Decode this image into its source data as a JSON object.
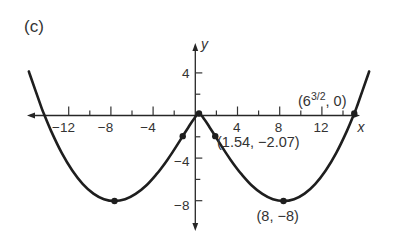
{
  "figure": {
    "panel_label": "(c)",
    "axis_labels": {
      "x": "x",
      "y": "y"
    },
    "x_tick_labels": [
      "−12",
      "−8",
      "−4",
      "4",
      "8",
      "12"
    ],
    "y_tick_labels": [
      "4",
      "−4",
      "−8"
    ],
    "annotations": {
      "inflection": "(1.54, −2.07)",
      "minimum": "(8, −8)",
      "zero": {
        "open": "(6",
        "sup": "3/2",
        "close": ", 0)"
      }
    }
  },
  "chart_data": {
    "type": "line",
    "title": "",
    "panel": "(c)",
    "xlabel": "x",
    "ylabel": "y",
    "xlim": [
      -16.1,
      16.1
    ],
    "ylim": [
      -10,
      6
    ],
    "grid": false,
    "legend": null,
    "x_ticks": [
      -12,
      -10,
      -8,
      -6,
      -4,
      -2,
      2,
      4,
      6,
      8,
      10,
      12,
      14
    ],
    "x_ticks_labeled": [
      -12,
      -8,
      -4,
      4,
      8,
      12
    ],
    "y_ticks": [
      4,
      2,
      -2,
      -4,
      -6,
      -8
    ],
    "y_ticks_labeled": [
      4,
      -4,
      -8
    ],
    "series": [
      {
        "name": "curve",
        "x": [
          -16.1,
          -16,
          -15,
          -14.7,
          -14,
          -13,
          -12,
          -11,
          -10,
          -9,
          -8,
          -7,
          -6,
          -5,
          -4,
          -3.5,
          -3,
          -2.5,
          -2,
          -1.54,
          -1,
          -0.5,
          0,
          0.5,
          1,
          1.54,
          2,
          2.5,
          3,
          3.5,
          4,
          5,
          6,
          7,
          8,
          9,
          10,
          11,
          12,
          13,
          14,
          14.7,
          15,
          16,
          16.1
        ],
        "y": [
          3.83,
          3.52,
          0.76,
          0,
          -1.61,
          -3.6,
          -5.21,
          -6.45,
          -7.32,
          -7.83,
          -8,
          -7.84,
          -7.35,
          -6.58,
          -5.52,
          -4.91,
          -4.24,
          -3.53,
          -2.78,
          -2.07,
          -1.25,
          -0.53,
          0,
          -0.53,
          -1.25,
          -2.07,
          -2.78,
          -3.53,
          -4.24,
          -4.91,
          -5.52,
          -6.58,
          -7.35,
          -7.84,
          -8,
          -7.83,
          -7.32,
          -6.45,
          -5.21,
          -3.6,
          -1.61,
          0,
          0.76,
          3.52,
          3.83
        ]
      }
    ],
    "marked_points": [
      {
        "x": 0,
        "y": 0,
        "label": ""
      },
      {
        "x": -1.54,
        "y": -2.07,
        "label": ""
      },
      {
        "x": 1.54,
        "y": -2.07,
        "label": "(1.54, −2.07)"
      },
      {
        "x": -8,
        "y": -8,
        "label": ""
      },
      {
        "x": 8,
        "y": -8,
        "label": "(8, −8)"
      },
      {
        "x": 14.7,
        "y": 0,
        "label": "(6^(3/2), 0)"
      }
    ]
  }
}
